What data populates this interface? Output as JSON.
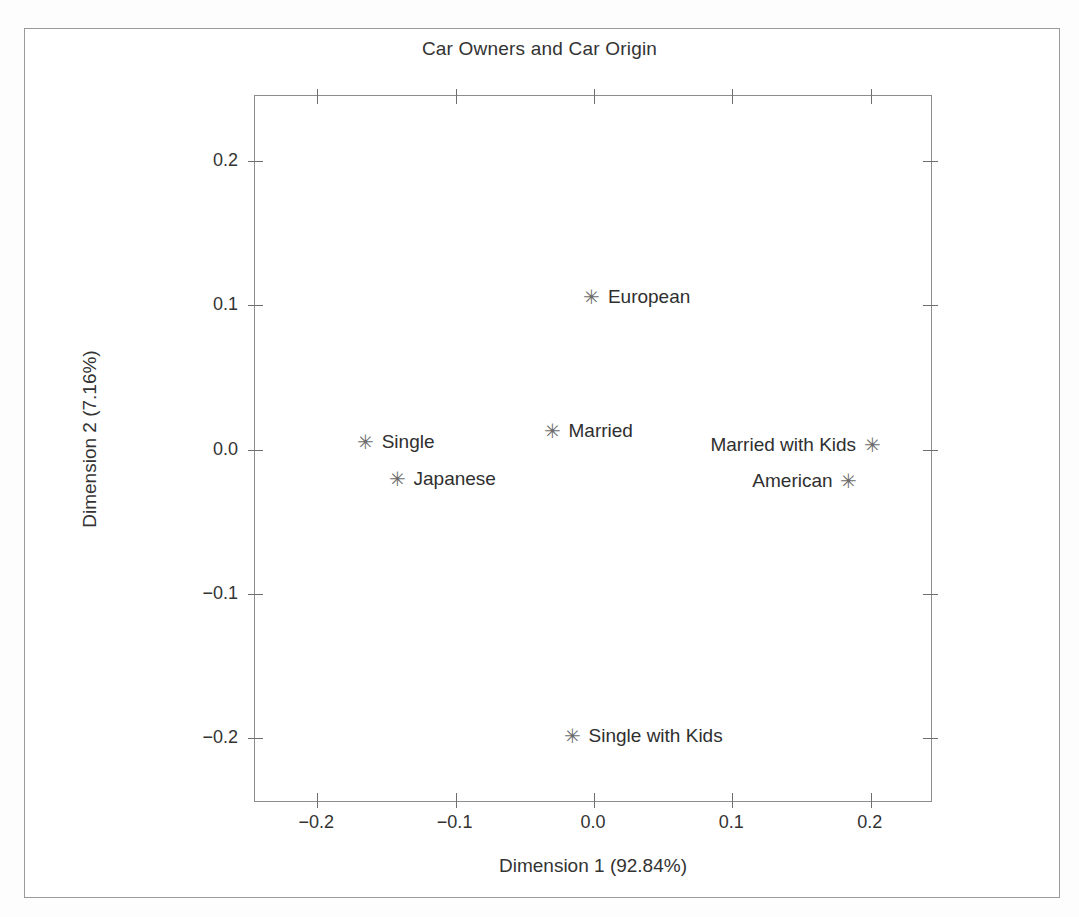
{
  "chart_data": {
    "type": "scatter",
    "title": "Car Owners and Car Origin",
    "xlabel": "Dimension 1 (92.84%)",
    "ylabel": "Dimension 2 (7.16%)",
    "xlim": [
      -0.245,
      0.245
    ],
    "ylim": [
      -0.245,
      0.245
    ],
    "grid": false,
    "legend": "none",
    "marker": "asterisk",
    "xticks": [
      -0.2,
      -0.1,
      0.0,
      0.1,
      0.2
    ],
    "xticklabels": [
      "−0.2",
      "−0.1",
      "0.0",
      "0.1",
      "0.2"
    ],
    "yticks": [
      -0.2,
      -0.1,
      0.0,
      0.1,
      0.2
    ],
    "yticklabels": [
      "−0.2",
      "−0.1",
      "0.0",
      "0.1",
      "0.2"
    ],
    "points": [
      {
        "label": "European",
        "x": -0.0015,
        "y": 0.1055,
        "label_side": "right"
      },
      {
        "label": "Married",
        "x": -0.03,
        "y": 0.0125,
        "label_side": "right"
      },
      {
        "label": "Single",
        "x": -0.165,
        "y": 0.0055,
        "label_side": "right"
      },
      {
        "label": "Japanese",
        "x": -0.142,
        "y": -0.0205,
        "label_side": "right"
      },
      {
        "label": "Married with Kids",
        "x": 0.201,
        "y": 0.003,
        "label_side": "left"
      },
      {
        "label": "American",
        "x": 0.184,
        "y": -0.0215,
        "label_side": "left"
      },
      {
        "label": "Single with Kids",
        "x": -0.0155,
        "y": -0.1985,
        "label_side": "right"
      }
    ]
  },
  "marker_glyph": "✳"
}
